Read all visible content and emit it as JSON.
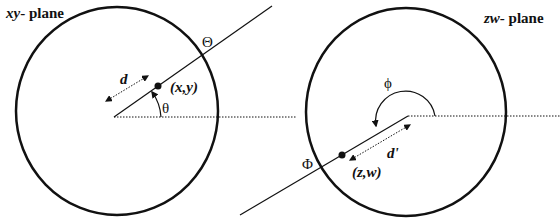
{
  "diagram": {
    "left_panel": {
      "plane_label_italic": "xy",
      "plane_label_rest": "- plane",
      "point_label": "(x,y)",
      "distance_label": "d",
      "angle_label": "θ",
      "boundary_label": "Θ"
    },
    "right_panel": {
      "plane_label_italic": "zw",
      "plane_label_rest": "- plane",
      "point_label": "(z,w)",
      "distance_label": "d'",
      "angle_label": "ϕ",
      "boundary_label": "Φ"
    },
    "colors": {
      "stroke": "#111111",
      "background": "#ffffff"
    }
  }
}
